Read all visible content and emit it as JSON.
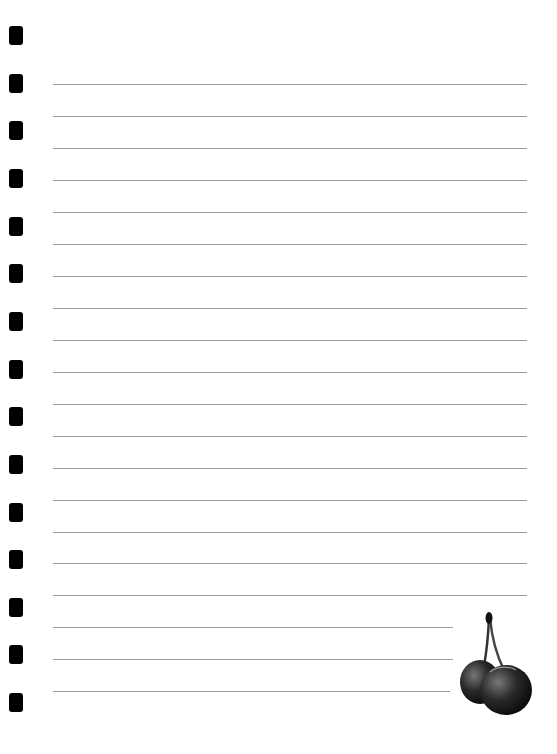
{
  "page": {
    "type": "lined notepaper",
    "background": "#ffffff",
    "line_color": "#9a9a9a",
    "hole_color": "#000000"
  },
  "holes_y": [
    35,
    83,
    130,
    178,
    226,
    273,
    321,
    369,
    416,
    464,
    512,
    559,
    607,
    654,
    702
  ],
  "lines": [
    {
      "y": 84,
      "right": 527
    },
    {
      "y": 116,
      "right": 527
    },
    {
      "y": 148,
      "right": 527
    },
    {
      "y": 180,
      "right": 527
    },
    {
      "y": 212,
      "right": 527
    },
    {
      "y": 244,
      "right": 527
    },
    {
      "y": 276,
      "right": 527
    },
    {
      "y": 308,
      "right": 527
    },
    {
      "y": 340,
      "right": 527
    },
    {
      "y": 372,
      "right": 527
    },
    {
      "y": 404,
      "right": 527
    },
    {
      "y": 436,
      "right": 527
    },
    {
      "y": 468,
      "right": 527
    },
    {
      "y": 500,
      "right": 527
    },
    {
      "y": 532,
      "right": 527
    },
    {
      "y": 563,
      "right": 527
    },
    {
      "y": 595,
      "right": 527
    },
    {
      "y": 627,
      "right": 453
    },
    {
      "y": 659,
      "right": 453
    },
    {
      "y": 691,
      "right": 450
    }
  ],
  "decoration": {
    "icon": "cherry-icon"
  }
}
